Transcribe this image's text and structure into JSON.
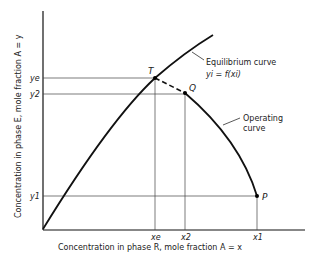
{
  "diagram": {
    "x_axis_label": "Concentration in phase R, mole fraction  A = x",
    "y_axis_label": "Concentration in phase E, mole fraction A = y",
    "y_ticks": [
      "ye",
      "y2",
      "y1"
    ],
    "x_ticks": [
      "xe",
      "x2",
      "x1"
    ],
    "points": {
      "T": "T",
      "Q": "Q",
      "P": "P"
    },
    "equilibrium_label_1": "Equilibrium curve",
    "equilibrium_label_2": "yi = f(xi)",
    "operating_label_1": "Operating",
    "operating_label_2": "curve",
    "colors": {
      "line": "#111111",
      "grid": "#444444",
      "text": "#222222"
    }
  }
}
